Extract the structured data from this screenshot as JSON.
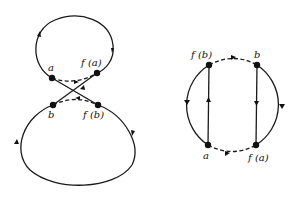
{
  "figure": {
    "left_diagram": {
      "description": "figure-eight curve with two crossing strands",
      "labels": {
        "a": "a",
        "fa": "f (a)",
        "b": "b",
        "fb": "f (b)"
      }
    },
    "right_diagram": {
      "description": "circle with two vertical chords",
      "labels": {
        "fb": "f (b)",
        "b": "b",
        "a": "a",
        "fa": "f (a)"
      }
    },
    "colors": {
      "ink": "#1a1a1a",
      "background": "#ffffff"
    }
  }
}
